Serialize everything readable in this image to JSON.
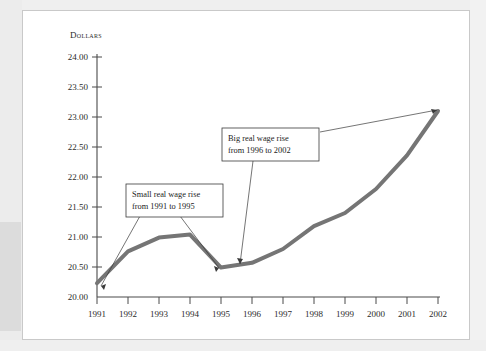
{
  "chart_data": {
    "type": "line",
    "title": "",
    "xlabel": "",
    "ylabel": "Dollars",
    "ylim": [
      20.0,
      24.0
    ],
    "ytick_step": 0.5,
    "grid": false,
    "legend": null,
    "categories": [
      "1991",
      "1992",
      "1993",
      "1994",
      "1995",
      "1996",
      "1997",
      "1998",
      "1999",
      "2000",
      "2001",
      "2002"
    ],
    "values": [
      20.23,
      20.76,
      20.99,
      21.04,
      20.49,
      20.57,
      20.8,
      21.18,
      21.4,
      21.8,
      22.36,
      23.1
    ],
    "series": [
      {
        "name": "Real wage",
        "values": [
          20.23,
          20.76,
          20.99,
          21.04,
          20.49,
          20.57,
          20.8,
          21.18,
          21.4,
          21.8,
          22.36,
          23.1
        ],
        "color": "#757575"
      }
    ],
    "ytick_labels": [
      "20.00",
      "20.50",
      "21.00",
      "21.50",
      "22.00",
      "22.50",
      "23.00",
      "23.50",
      "24.00"
    ],
    "xtick_labels": [
      "1991",
      "1992",
      "1993",
      "1994",
      "1995",
      "1996",
      "1997",
      "1998",
      "1999",
      "2000",
      "2001",
      "2002"
    ],
    "annotations": [
      {
        "id": "small-rise",
        "line1": "Small real wage rise",
        "line2": "from 1991 to 1995",
        "points_to": [
          "1991",
          "1995"
        ]
      },
      {
        "id": "big-rise",
        "line1": "Big real wage rise",
        "line2": "from 1996 to 2002",
        "points_to": [
          "1996",
          "2002"
        ]
      }
    ]
  },
  "axis": {
    "y_title": "Dollars"
  },
  "colors": {
    "line": "#757575",
    "axis": "#4a4a4a",
    "text": "#1c1c1c",
    "card_background": "#ffffff",
    "page_margin": "#ececec"
  }
}
